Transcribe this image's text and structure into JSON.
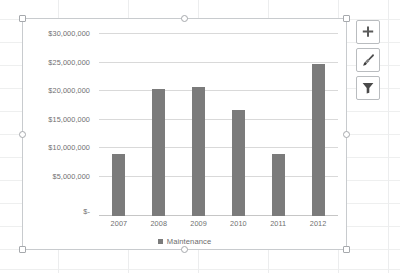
{
  "app": {
    "context": "excel-worksheet-with-selected-chart"
  },
  "chart_data": {
    "type": "bar",
    "title": "",
    "subtitle": "",
    "xlabel": "",
    "ylabel": "",
    "categories": [
      "2007",
      "2008",
      "2009",
      "2010",
      "2011",
      "2012"
    ],
    "series": [
      {
        "name": "Maintenance",
        "color": "#7b7b7b",
        "values": [
          10200000,
          20900000,
          21300000,
          17500000,
          10300000,
          25000000
        ]
      }
    ],
    "y_ticks": [
      {
        "label": "$30,000,000",
        "value": 30000000
      },
      {
        "label": "$25,000,000",
        "value": 25000000
      },
      {
        "label": "$20,000,000",
        "value": 20000000
      },
      {
        "label": "$15,000,000",
        "value": 15000000
      },
      {
        "label": "$10,000,000",
        "value": 10000000
      },
      {
        "label": "$5,000,000",
        "value": 5000000
      },
      {
        "label": "$-",
        "value": 0
      }
    ],
    "ylim": [
      0,
      30000000
    ],
    "grid": true,
    "legend": {
      "position": "bottom",
      "entries": [
        "Maintenance"
      ]
    }
  },
  "legend": {
    "label": "Maintenance"
  },
  "chart_tools": {
    "elements_button": {
      "name": "Chart Elements",
      "icon": "plus-icon"
    },
    "styles_button": {
      "name": "Chart Styles",
      "icon": "paintbrush-icon"
    },
    "filters_button": {
      "name": "Chart Filters",
      "icon": "funnel-icon"
    }
  },
  "selection": {
    "state": "chart-selected",
    "handle_count": 8
  },
  "colors": {
    "bar": "#7b7b7b",
    "gridline": "#d9d9d9",
    "axis_text": "#6f6f6f",
    "chart_border": "#c8cbce",
    "sheet_gridline": "#e9eaec"
  }
}
